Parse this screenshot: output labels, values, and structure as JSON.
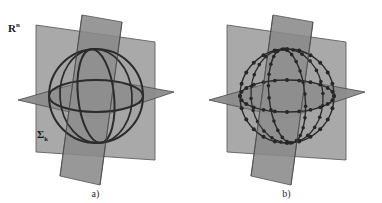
{
  "figure": {
    "background_color": "#ffffff",
    "width": 382,
    "height": 203
  },
  "style": {
    "plane_fill": "#9a9a9a",
    "plane_fill_dark": "#7e7e7e",
    "plane_fill_light": "#adadad",
    "plane_stroke": "#4a4a4a",
    "curve_stroke": "#2b2b2b",
    "marker_fill": "#262626",
    "label_color": "#1c1c1c",
    "caption_color": "#2a2a2a"
  },
  "panels": [
    {
      "id": "a",
      "caption": "a)",
      "label_top": "R",
      "label_top_superscript": "n",
      "label_bottom": "Σ",
      "label_bottom_subscript": "k",
      "curve_style": "smooth",
      "markers": false,
      "description": "Sphere with three great circles cut by three mutually orthogonal planes"
    },
    {
      "id": "b",
      "caption": "b)",
      "label_top": "⌐N",
      "curve_style": "discretized",
      "markers": true,
      "marker_count_per_circle": 24,
      "description": "Discretized sphere: great circles sampled with point markers"
    }
  ],
  "geometry": {
    "sphere_center": [
      96,
      96
    ],
    "sphere_radius": 47,
    "equator_ry": 17,
    "meridian_rx": 18,
    "vertical_plane_1": "back-left vertical rectangle",
    "vertical_plane_2": "front vertical rectangle rotated",
    "horizontal_plane": "flat parallelogram through equator"
  }
}
